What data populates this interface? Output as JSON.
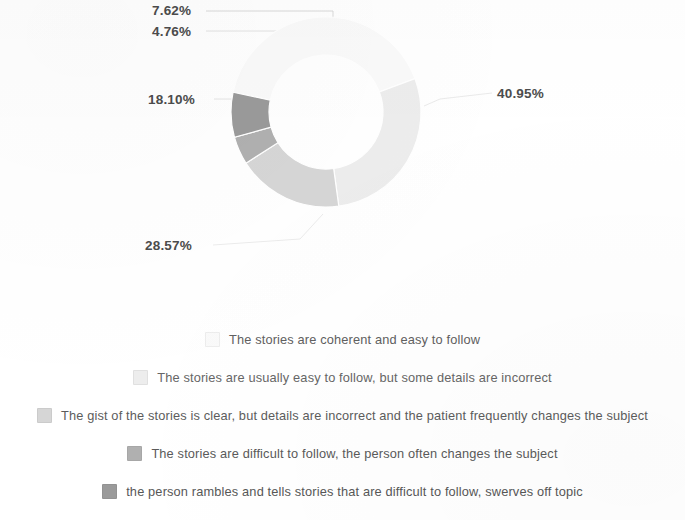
{
  "chart_data": {
    "type": "pie",
    "variant": "donut",
    "title": "",
    "xlabel": "",
    "ylabel": "",
    "legend_position": "bottom",
    "grid": false,
    "categories": [
      "The stories are coherent and easy to follow",
      "The stories are usually easy to follow, but some details are incorrect",
      "The gist of the stories is clear, but details are incorrect and the patient frequently changes the subject",
      "The stories are difficult to follow, the person often changes the subject",
      "the person rambles and tells stories that are difficult to follow, swerves off topic"
    ],
    "values": [
      40.95,
      28.57,
      18.1,
      4.76,
      7.62
    ],
    "data_labels": [
      "40.95%",
      "28.57%",
      "18.10%",
      "4.76%",
      "7.62%"
    ],
    "colors": [
      "#fafafa",
      "#ededed",
      "#d6d6d6",
      "#b0b0b0",
      "#9a9a9a"
    ]
  },
  "chart": {
    "slices": [
      {
        "label": "40.95%",
        "value": 40.95,
        "color": "#fafafa"
      },
      {
        "label": "28.57%",
        "value": 28.57,
        "color": "#ededed"
      },
      {
        "label": "18.10%",
        "value": 18.1,
        "color": "#d6d6d6"
      },
      {
        "label": "4.76%",
        "value": 4.76,
        "color": "#b0b0b0"
      },
      {
        "label": "7.62%",
        "value": 7.62,
        "color": "#9a9a9a"
      }
    ]
  },
  "legend": {
    "items": [
      {
        "label": "The stories are coherent and easy to follow",
        "color": "#fafafa"
      },
      {
        "label": "The stories are usually easy to follow, but some details are incorrect",
        "color": "#ededed"
      },
      {
        "label": "The gist of the stories is clear, but details are incorrect and the patient frequently changes the subject",
        "color": "#d6d6d6"
      },
      {
        "label": "The stories are difficult to follow, the person often changes the subject",
        "color": "#b0b0b0"
      },
      {
        "label": "the person rambles and tells stories that are difficult to follow, swerves off topic",
        "color": "#9a9a9a"
      }
    ]
  }
}
